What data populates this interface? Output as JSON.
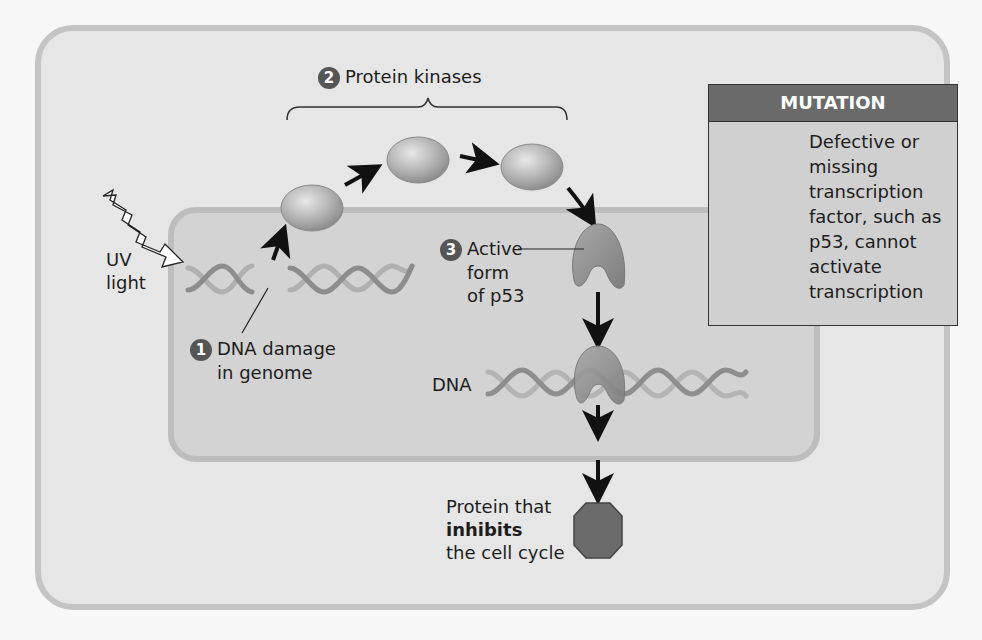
{
  "diagram": {
    "steps": [
      {
        "number": "1",
        "label_lines": [
          "DNA damage",
          "in genome"
        ]
      },
      {
        "number": "2",
        "label": "Protein kinases"
      },
      {
        "number": "3",
        "label_lines": [
          "Active",
          "form",
          "of p53"
        ]
      }
    ],
    "uv_label_lines": [
      "UV",
      "light"
    ],
    "dna_label": "DNA",
    "product": {
      "line1": "Protein that",
      "line2_bold": "inhibits",
      "line3": "the cell cycle"
    },
    "mutation_box": {
      "header": "MUTATION",
      "text_lines": [
        "Defective or",
        "missing",
        "transcription",
        "factor, such as",
        "p53, cannot",
        "activate",
        "transcription"
      ]
    },
    "colors": {
      "outer_bg": "#e6e6e6",
      "outer_border": "#c4c4c4",
      "nucleus_bg": "#d3d3d3",
      "mutation_header_bg": "#6a6a6a",
      "step_badge": "#555555",
      "protein": "#9a9a9a",
      "inhibitor": "#6b6b6b"
    }
  }
}
